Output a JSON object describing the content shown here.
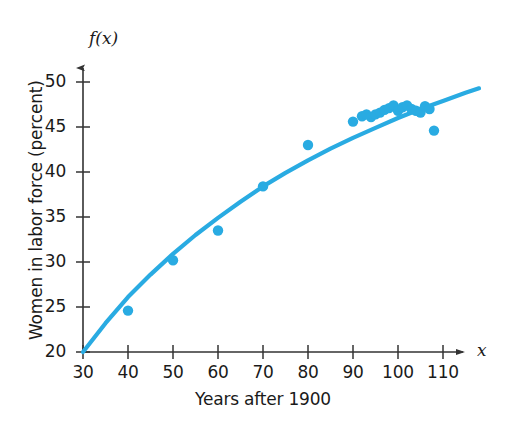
{
  "chart_data": {
    "type": "scatter",
    "title": "",
    "subtitle": "",
    "xlabel": "Years after 1900",
    "ylabel": "Women in labor force (percent)",
    "x_variable_label": "x",
    "y_variable_label": "f(x)",
    "xlim": [
      30,
      118
    ],
    "ylim": [
      20,
      51
    ],
    "xticks": [
      30,
      40,
      50,
      60,
      70,
      80,
      90,
      100,
      110
    ],
    "yticks": [
      20,
      25,
      30,
      35,
      40,
      45,
      50
    ],
    "xtick_labels": [
      "30",
      "40",
      "50",
      "60",
      "70",
      "80",
      "90",
      "100",
      "110"
    ],
    "ytick_labels": [
      "20",
      "25",
      "30",
      "35",
      "40",
      "45",
      "50"
    ],
    "grid": false,
    "legend": null,
    "legend_position": "none",
    "accent_color": "#29ABE2",
    "axis_color": "#333333",
    "series": [
      {
        "name": "Women in labor force (percent)",
        "type": "scatter",
        "marker": "circle",
        "color": "#29ABE2",
        "points": [
          [
            40,
            24.6
          ],
          [
            50,
            30.2
          ],
          [
            60,
            33.5
          ],
          [
            70,
            38.4
          ],
          [
            80,
            43.0
          ],
          [
            90,
            45.6
          ],
          [
            92,
            46.2
          ],
          [
            93,
            46.4
          ],
          [
            94,
            46.1
          ],
          [
            95,
            46.4
          ],
          [
            96,
            46.6
          ],
          [
            97,
            46.9
          ],
          [
            98,
            47.1
          ],
          [
            99,
            47.4
          ],
          [
            100,
            46.8
          ],
          [
            101,
            47.2
          ],
          [
            102,
            47.4
          ],
          [
            103,
            47.0
          ],
          [
            104,
            46.8
          ],
          [
            105,
            46.6
          ],
          [
            106,
            47.3
          ],
          [
            107,
            47.0
          ],
          [
            108,
            44.6
          ]
        ]
      },
      {
        "name": "model curve f(x)",
        "type": "line",
        "color": "#29ABE2",
        "points": [
          [
            30,
            20.0
          ],
          [
            35,
            23.2
          ],
          [
            40,
            26.1
          ],
          [
            45,
            28.6
          ],
          [
            50,
            30.9
          ],
          [
            55,
            33.0
          ],
          [
            60,
            34.9
          ],
          [
            65,
            36.7
          ],
          [
            70,
            38.4
          ],
          [
            75,
            39.9
          ],
          [
            80,
            41.3
          ],
          [
            85,
            42.6
          ],
          [
            90,
            43.8
          ],
          [
            95,
            44.9
          ],
          [
            100,
            46.0
          ],
          [
            105,
            47.0
          ],
          [
            110,
            47.9
          ],
          [
            115,
            48.8
          ],
          [
            118,
            49.3
          ]
        ]
      }
    ]
  },
  "axes": {
    "x_title": "Years after 1900",
    "y_title": "Women in labor force (percent)",
    "x_symbol": "x",
    "y_symbol": "f(x)"
  }
}
